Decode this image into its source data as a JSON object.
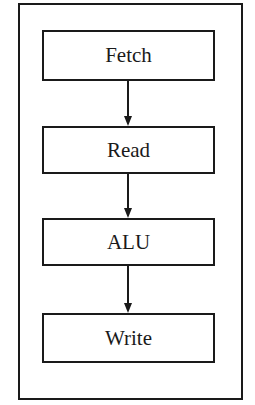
{
  "diagram": {
    "type": "flowchart",
    "direction": "top-to-bottom",
    "stages": [
      {
        "label": "Fetch"
      },
      {
        "label": "Read"
      },
      {
        "label": "ALU"
      },
      {
        "label": "Write"
      }
    ],
    "edges": [
      {
        "from": "Fetch",
        "to": "Read"
      },
      {
        "from": "Read",
        "to": "ALU"
      },
      {
        "from": "ALU",
        "to": "Write"
      }
    ],
    "colors": {
      "stroke": "#1a1a1a",
      "background": "#ffffff"
    }
  }
}
